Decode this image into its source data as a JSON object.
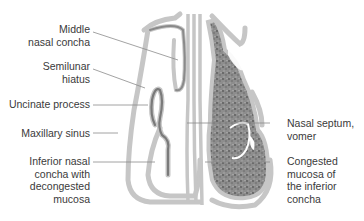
{
  "figure": {
    "colors": {
      "bone": "#c4c4c4",
      "mucosa_outline": "#8a8a8a",
      "congested_fill": "#7a7a7a",
      "leader_line": "#8c8c8c",
      "text": "#3a3a3a"
    },
    "labels_left": [
      {
        "id": "middle-nasal-concha",
        "lines": [
          "Middle",
          "nasal concha"
        ]
      },
      {
        "id": "semilunar-hiatus",
        "lines": [
          "Semilunar",
          "hiatus"
        ]
      },
      {
        "id": "uncinate-process",
        "lines": [
          "Uncinate process"
        ]
      },
      {
        "id": "maxillary-sinus",
        "lines": [
          "Maxillary sinus"
        ]
      },
      {
        "id": "inferior-nasal-concha",
        "lines": [
          "Inferior nasal",
          "concha with",
          "decongested",
          "mucosa"
        ]
      }
    ],
    "labels_right": [
      {
        "id": "nasal-septum",
        "lines": [
          "Nasal septum,",
          "vomer"
        ]
      },
      {
        "id": "congested-mucosa",
        "lines": [
          "Congested",
          "mucosa of",
          "the inferior",
          "concha"
        ]
      }
    ]
  }
}
